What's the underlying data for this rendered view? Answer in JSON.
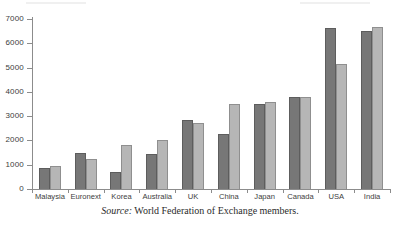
{
  "caption": {
    "source_label": "Source:",
    "text": " World Federation of Exchange members."
  },
  "colors": {
    "series_1": "#777777",
    "series_2": "#b6b6b6",
    "axis": "#8c8c8c",
    "text": "#3d3d3d",
    "background": "#ffffff"
  },
  "chart_data": {
    "type": "bar",
    "title": "",
    "subtitle": "",
    "xlabel": "",
    "ylabel": "",
    "ylim": [
      0,
      7000
    ],
    "yticks": [
      0,
      1000,
      2000,
      3000,
      4000,
      5000,
      6000,
      7000
    ],
    "ytick_labels": [
      "0",
      "1000",
      "2000",
      "3000",
      "4000",
      "5000",
      "6000",
      "7000"
    ],
    "grid": false,
    "legend": false,
    "legend_position": "none",
    "categories": [
      "Malaysia",
      "Euronext",
      "Korea",
      "Australia",
      "UK",
      "China",
      "Japan",
      "Canada",
      "USA",
      "India"
    ],
    "series": [
      {
        "name": "Series 1",
        "color": "#777777",
        "values": [
          870,
          1500,
          700,
          1450,
          2850,
          2250,
          3500,
          3800,
          6650,
          6500
        ]
      },
      {
        "name": "Series 2",
        "color": "#b6b6b6",
        "values": [
          950,
          1220,
          1800,
          2030,
          2700,
          3520,
          3580,
          3780,
          5150,
          6680
        ]
      }
    ]
  }
}
